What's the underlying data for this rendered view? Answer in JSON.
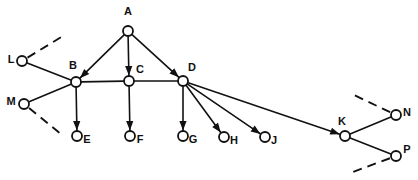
{
  "diagram": {
    "title": "",
    "background_color": "#ffffff",
    "stroke_color": "#111111",
    "node_radius": 5,
    "nodes": [
      {
        "id": "A",
        "label": "A",
        "x": 128,
        "y": 31,
        "label_x": 128,
        "label_y": 12,
        "label_anchor": "middle"
      },
      {
        "id": "L",
        "label": "L",
        "x": 22,
        "y": 61,
        "label_x": 11,
        "label_y": 60,
        "label_anchor": "middle"
      },
      {
        "id": "B",
        "label": "B",
        "x": 76,
        "y": 82,
        "label_x": 73,
        "label_y": 66,
        "label_anchor": "middle"
      },
      {
        "id": "C",
        "label": "C",
        "x": 129,
        "y": 81,
        "label_x": 140,
        "label_y": 70,
        "label_anchor": "middle"
      },
      {
        "id": "D",
        "label": "D",
        "x": 183,
        "y": 81,
        "label_x": 192,
        "label_y": 68,
        "label_anchor": "middle"
      },
      {
        "id": "M",
        "label": "M",
        "x": 24,
        "y": 104,
        "label_x": 11,
        "label_y": 102,
        "label_anchor": "middle"
      },
      {
        "id": "E",
        "label": "E",
        "x": 77,
        "y": 136,
        "label_x": 87,
        "label_y": 140,
        "label_anchor": "middle"
      },
      {
        "id": "F",
        "label": "F",
        "x": 130,
        "y": 136,
        "label_x": 140,
        "label_y": 140,
        "label_anchor": "middle"
      },
      {
        "id": "G",
        "label": "G",
        "x": 183,
        "y": 136,
        "label_x": 193,
        "label_y": 140,
        "label_anchor": "middle"
      },
      {
        "id": "H",
        "label": "H",
        "x": 224,
        "y": 137,
        "label_x": 234,
        "label_y": 141,
        "label_anchor": "middle"
      },
      {
        "id": "J",
        "label": "J",
        "x": 265,
        "y": 137,
        "label_x": 274,
        "label_y": 141,
        "label_anchor": "middle"
      },
      {
        "id": "K",
        "label": "K",
        "x": 345,
        "y": 136,
        "label_x": 342,
        "label_y": 122,
        "label_anchor": "middle"
      },
      {
        "id": "N",
        "label": "N",
        "x": 396,
        "y": 115,
        "label_x": 407,
        "label_y": 113,
        "label_anchor": "middle"
      },
      {
        "id": "P",
        "label": "P",
        "x": 396,
        "y": 156,
        "label_x": 407,
        "label_y": 150,
        "label_anchor": "middle"
      }
    ],
    "edges": [
      {
        "id": "A-B",
        "from": "A",
        "to": "B",
        "style": "solid",
        "arrow": "to"
      },
      {
        "id": "A-C",
        "from": "A",
        "to": "C",
        "style": "solid",
        "arrow": "to"
      },
      {
        "id": "A-D",
        "from": "A",
        "to": "D",
        "style": "solid",
        "arrow": "to"
      },
      {
        "id": "L-B",
        "from": "L",
        "to": "B",
        "style": "solid",
        "arrow": "none"
      },
      {
        "id": "M-B",
        "from": "M",
        "to": "B",
        "style": "solid",
        "arrow": "none"
      },
      {
        "id": "B-C",
        "from": "B",
        "to": "C",
        "style": "solid",
        "arrow": "none"
      },
      {
        "id": "C-D",
        "from": "C",
        "to": "D",
        "style": "solid",
        "arrow": "none"
      },
      {
        "id": "B-E",
        "from": "B",
        "to": "E",
        "style": "solid",
        "arrow": "to"
      },
      {
        "id": "C-F",
        "from": "C",
        "to": "F",
        "style": "solid",
        "arrow": "to"
      },
      {
        "id": "D-G",
        "from": "D",
        "to": "G",
        "style": "solid",
        "arrow": "to"
      },
      {
        "id": "D-H",
        "from": "D",
        "to": "H",
        "style": "solid",
        "arrow": "to"
      },
      {
        "id": "D-J",
        "from": "D",
        "to": "J",
        "style": "solid",
        "arrow": "to"
      },
      {
        "id": "D-K",
        "from": "D",
        "to": "K",
        "style": "solid",
        "arrow": "to"
      },
      {
        "id": "K-N",
        "from": "K",
        "to": "N",
        "style": "solid",
        "arrow": "none"
      },
      {
        "id": "K-P",
        "from": "K",
        "to": "P",
        "style": "solid",
        "arrow": "none"
      }
    ],
    "dangling_edges": [
      {
        "id": "L-dashed",
        "from": "L",
        "x2": 63,
        "y2": 36,
        "style": "dashed"
      },
      {
        "id": "M-dashed",
        "from": "M",
        "x2": 61,
        "y2": 134,
        "style": "dashed"
      },
      {
        "id": "N-dashed",
        "from": "N",
        "x2": 354,
        "y2": 95,
        "style": "dashed"
      },
      {
        "id": "P-dashed",
        "from": "P",
        "x2": 350,
        "y2": 173,
        "style": "dashed"
      }
    ]
  }
}
